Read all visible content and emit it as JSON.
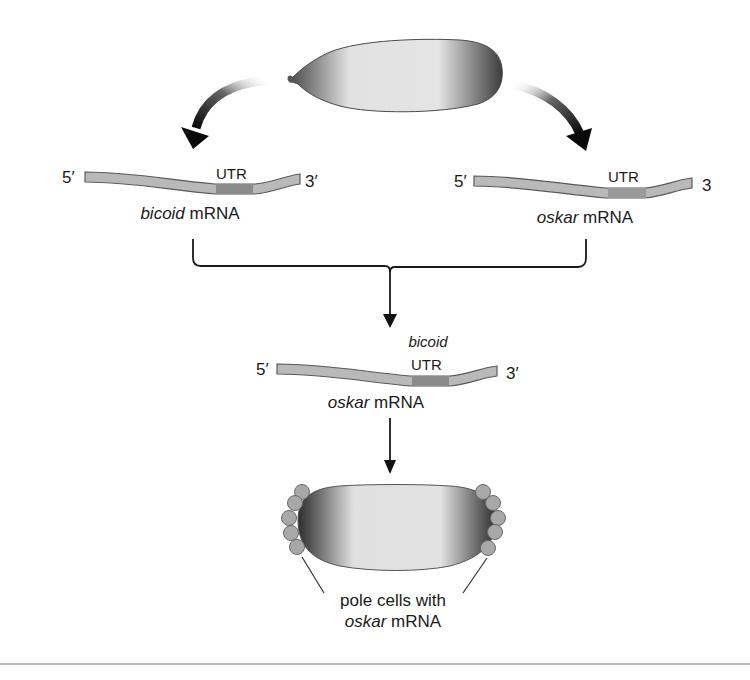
{
  "figure": {
    "type": "biology-schematic"
  },
  "top_embryo": {
    "name": "oocyte / early embryo"
  },
  "left_strand": {
    "five_prime": "5′",
    "three_prime": "3′",
    "utr_label": "UTR",
    "gene": "bicoid",
    "suffix": " mRNA"
  },
  "right_strand": {
    "five_prime": "5′",
    "three_prime": "3",
    "utr_label": "UTR",
    "gene": "oskar",
    "suffix": " mRNA"
  },
  "fused_strand": {
    "five_prime": "5′",
    "three_prime": "3′",
    "utr_prefix": "bicoid",
    "utr_label": "UTR",
    "gene": "oskar",
    "suffix": " mRNA"
  },
  "bottom_embryo": {
    "caption_line1": "pole cells with",
    "caption_gene": "oskar",
    "caption_suffix": " mRNA"
  },
  "colors": {
    "strand_fill": "#b9b9b9",
    "strand_edge": "#5a5a5a",
    "utr_fill": "#8a8a8a",
    "embryo_dark": "#3a3a3a",
    "embryo_light": "#e6e6e6",
    "pole_cell": "#a8a8a8",
    "arrow": "#111111",
    "rule": "#b8b8b8"
  }
}
